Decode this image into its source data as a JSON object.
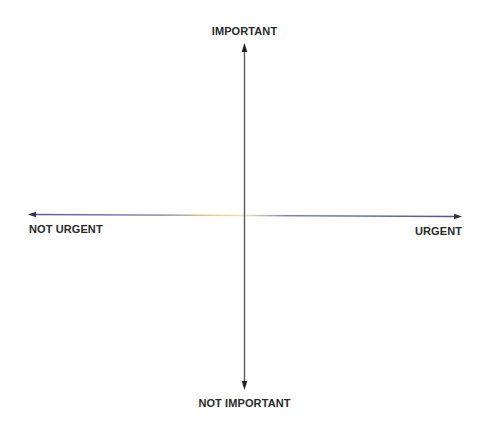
{
  "diagram": {
    "type": "quadrant-matrix",
    "axes": {
      "vertical": {
        "top_label": "IMPORTANT",
        "bottom_label": "NOT IMPORTANT",
        "color": "#555555"
      },
      "horizontal": {
        "left_label": "NOT URGENT",
        "right_label": "URGENT",
        "color": "#6a6ab0",
        "highlight_color": "#e8e0a0"
      }
    },
    "background": "#ffffff",
    "label_color": "#2a2a2a"
  }
}
